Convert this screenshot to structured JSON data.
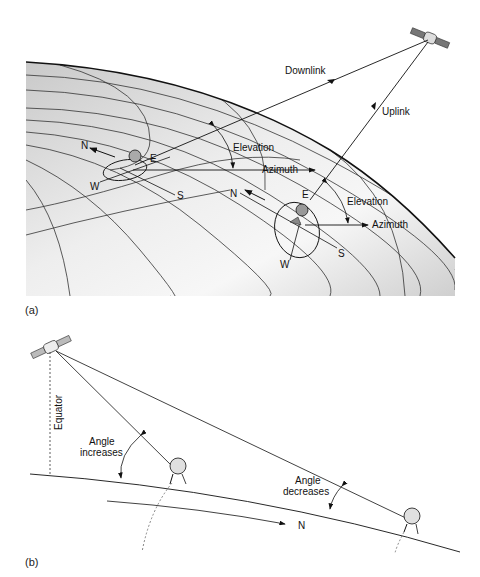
{
  "figure_a": {
    "caption": "(a)",
    "labels": {
      "downlink": "Downlink",
      "uplink": "Uplink",
      "elevation_1": "Elevation",
      "azimuth_1": "Azimuth",
      "elevation_2": "Elevation",
      "azimuth_2": "Azimuth",
      "n_1": "N",
      "e_1": "E",
      "w_1": "W",
      "s_1": "S",
      "n_2": "N",
      "e_2": "E",
      "w_2": "W",
      "s_2": "S"
    },
    "colors": {
      "earth_shade": "#d4d4d4",
      "line": "#222222"
    }
  },
  "figure_b": {
    "caption": "(b)",
    "labels": {
      "equator": "Equator",
      "angle_increases_1": "Angle",
      "angle_increases_2": "increases",
      "angle_decreases_1": "Angle",
      "angle_decreases_2": "decreases",
      "north": "N"
    }
  }
}
